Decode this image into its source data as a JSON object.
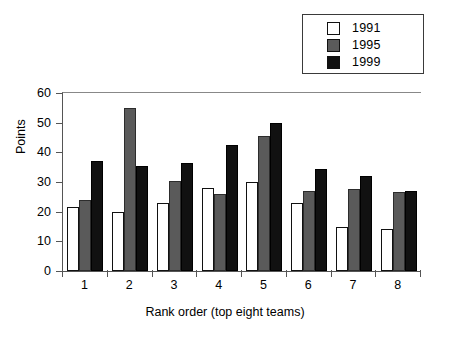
{
  "chart_data": {
    "type": "bar",
    "title": "",
    "xlabel": "Rank order (top eight teams)",
    "ylabel": "Points",
    "categories": [
      "1",
      "2",
      "3",
      "4",
      "5",
      "6",
      "7",
      "8"
    ],
    "series": [
      {
        "name": "1991",
        "color": "#ffffff",
        "values": [
          21.5,
          20,
          23,
          28,
          30,
          23,
          15,
          14
        ]
      },
      {
        "name": "1995",
        "color": "#5a5a5a",
        "values": [
          24,
          55,
          30.5,
          26,
          45.5,
          27,
          27.5,
          26.5
        ]
      },
      {
        "name": "1999",
        "color": "#111111",
        "values": [
          37,
          35.5,
          36.5,
          42.5,
          50,
          34.5,
          32,
          27
        ]
      }
    ],
    "ylim": [
      0,
      60
    ],
    "yticks": [
      0,
      10,
      20,
      30,
      40,
      50,
      60
    ],
    "ytick_labels": [
      "0",
      "10",
      "20",
      "30",
      "40",
      "50",
      "60"
    ],
    "grid": false,
    "legend_position": "top-right",
    "legend_entries": [
      "1991",
      "1995",
      "1999"
    ]
  }
}
